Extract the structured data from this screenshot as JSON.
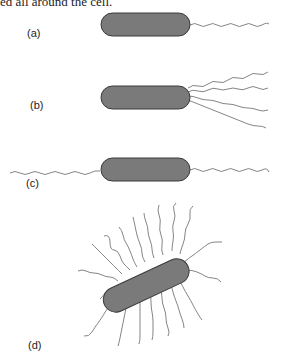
{
  "caption_fragment": "ed all around the cell.",
  "panels": [
    {
      "label": "(a)",
      "arrangement": "monotrichous"
    },
    {
      "label": "(b)",
      "arrangement": "lophotrichous"
    },
    {
      "label": "(c)",
      "arrangement": "amphitrichous"
    },
    {
      "label": "(d)",
      "arrangement": "peritrichous"
    }
  ],
  "colors": {
    "cell_fill": "#7a7a7a",
    "cell_stroke": "#3a3a3a",
    "flagellum": "#777777"
  }
}
